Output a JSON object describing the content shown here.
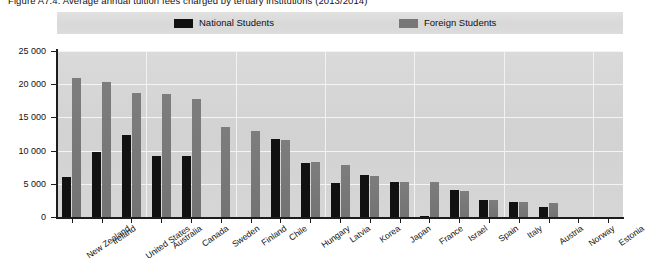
{
  "figure": {
    "title_clipped": "Figure A7.4. Average annual tuition fees charged by tertiary institutions (2013/2014)",
    "background_color": "#ffffff",
    "plot_background_color": "#d5d5d5",
    "legend_band_color": "#dcdcdc"
  },
  "legend": {
    "position": "top",
    "entries": [
      {
        "label": "National Students",
        "color": "#111111",
        "swatch": "legend-swatch-national"
      },
      {
        "label": "Foreign Students",
        "color": "#777777",
        "swatch": "legend-swatch-foreign"
      }
    ]
  },
  "axes": {
    "y": {
      "ticks": [
        "0",
        "5 000",
        "10 000",
        "15 000",
        "20 000",
        "25 000"
      ],
      "min": 0,
      "max": 25000,
      "step": 5000
    },
    "x": {
      "label": ""
    }
  },
  "chart_data": {
    "type": "bar",
    "title": "Figure A7.4. Average annual tuition fees charged by tertiary institutions (2013/2014)",
    "xlabel": "",
    "ylabel": "",
    "ylim": [
      0,
      25000
    ],
    "ytick_values": [
      0,
      5000,
      10000,
      15000,
      20000,
      25000
    ],
    "ytick_labels": [
      "0",
      "5 000",
      "10 000",
      "15 000",
      "20 000",
      "25 000"
    ],
    "grid": true,
    "legend_position": "top",
    "categories": [
      "New Zealand",
      "Ireland",
      "United States",
      "Australia",
      "Canada",
      "Sweden",
      "Finland",
      "Chile",
      "Hungary",
      "Latvia",
      "Korea",
      "Japan",
      "France",
      "Israel",
      "Spain",
      "Italy",
      "Austria",
      "Norway",
      "Estonia"
    ],
    "series": [
      {
        "name": "National Students",
        "color": "#111111",
        "values": [
          6000,
          9800,
          12300,
          9200,
          9200,
          0,
          0,
          11700,
          8200,
          5100,
          6300,
          5300,
          200,
          4000,
          2600,
          2200,
          1500,
          0,
          0
        ]
      },
      {
        "name": "Foreign Students",
        "color": "#777777",
        "values": [
          21000,
          20300,
          18600,
          18500,
          17700,
          13500,
          13000,
          11600,
          8300,
          7800,
          6200,
          5300,
          5300,
          3900,
          2600,
          2300,
          2100,
          0,
          0
        ]
      }
    ]
  }
}
